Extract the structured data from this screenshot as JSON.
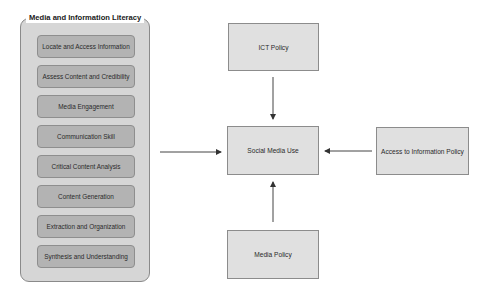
{
  "group": {
    "title": "Media and Information Literacy",
    "items": [
      "Locate and Access Information",
      "Assess Content and Credibility",
      "Media Engagement",
      "Communication Skill",
      "Critical Content Analysis",
      "Content Generation",
      "Extraction and Organization",
      "Synthesis and Understanding"
    ]
  },
  "nodes": {
    "ict_policy": "ICT Policy",
    "social_media_use": "Social Media Use",
    "access_policy": "Access to Information Policy",
    "media_policy": "Media Policy"
  },
  "edges": [
    {
      "from": "Media and Information Literacy",
      "to": "Social Media Use"
    },
    {
      "from": "ICT Policy",
      "to": "Social Media Use"
    },
    {
      "from": "Access to Information Policy",
      "to": "Social Media Use"
    },
    {
      "from": "Media Policy",
      "to": "Social Media Use"
    }
  ]
}
